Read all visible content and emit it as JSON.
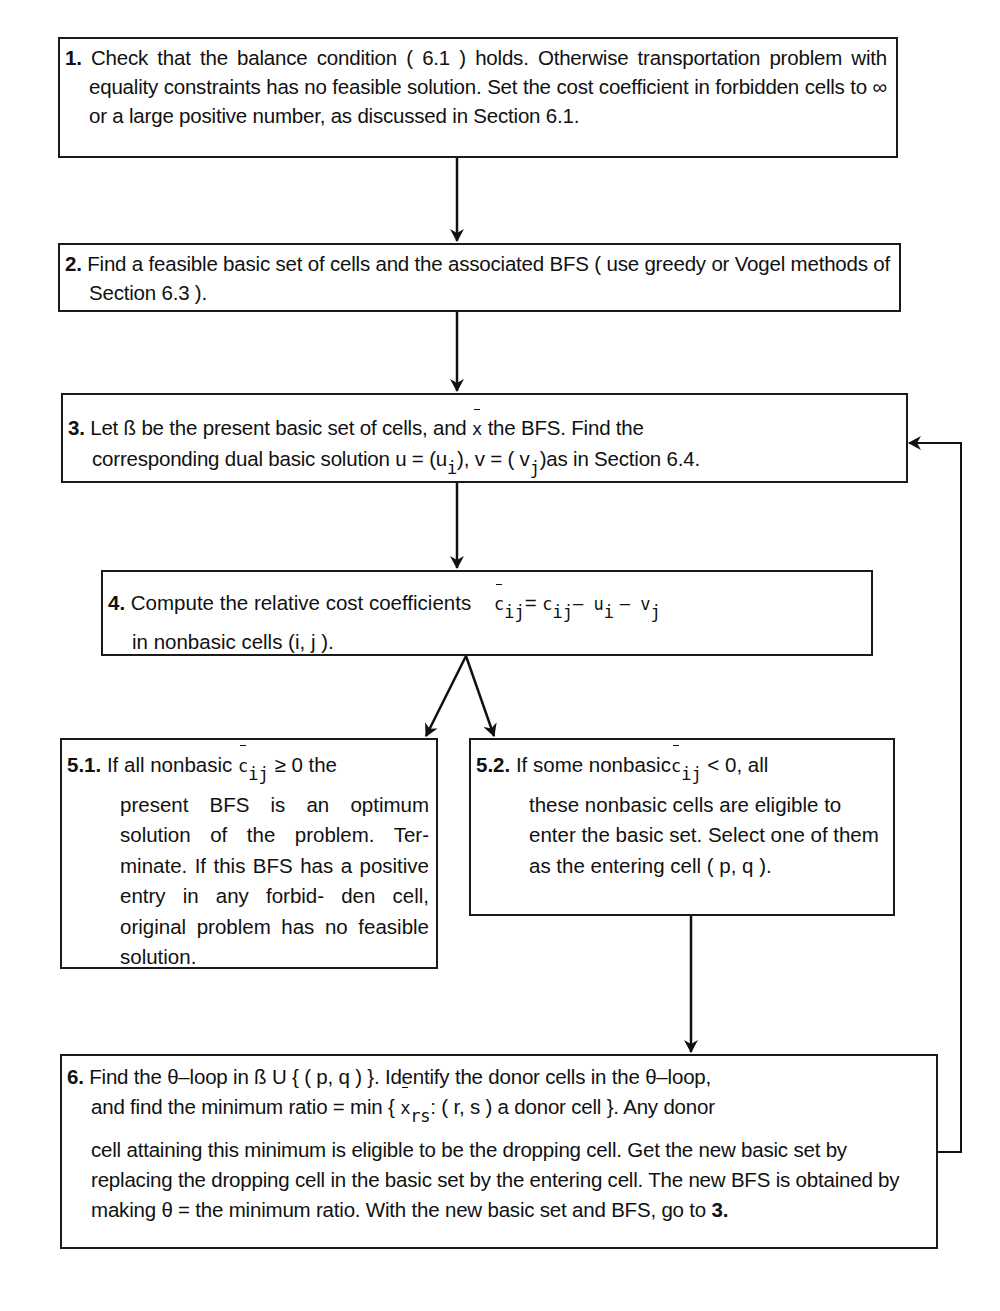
{
  "diagram": {
    "steps": [
      {
        "id": "1",
        "label": "1.",
        "text": "Check that the balance condition ( 6.1 ) holds. Otherwise transportation problem with equality constraints has no feasible solution. Set the cost coefficient in forbidden cells to ∞ or a large positive number, as discussed in Section 6.1."
      },
      {
        "id": "2",
        "label": "2.",
        "text": "Find a feasible basic set of cells and the associated BFS ( use greedy or Vogel methods of Section 6.3 )."
      },
      {
        "id": "3",
        "label": "3.",
        "line1_a": "Let ß be the present basic set of cells, and",
        "line1_sym": "x",
        "line1_b": "the BFS. Find the",
        "line2_a": "corresponding dual basic solution u = (u",
        "line2_sub1": "i",
        "line2_b": "), v = ( v",
        "line2_sub2": "j",
        "line2_c": ")as in Section 6.4."
      },
      {
        "id": "4",
        "label": "4.",
        "line1": "Compute the relative cost coefficients",
        "formula_lhs": "c",
        "formula_lhs_sub": "ij",
        "formula_eq": "=",
        "formula_c": "c",
        "formula_c_sub": "ij",
        "formula_minus1": "– u",
        "formula_u_sub": "i",
        "formula_minus2": "– v",
        "formula_v_sub": "j",
        "line2": "in nonbasic cells (i, j )."
      },
      {
        "id": "5.1",
        "label": "5.1.",
        "line1_a": "If all nonbasic",
        "line1_sym": "c",
        "line1_sub": "ij",
        "line1_rel": "≥",
        "line1_b": "0 the",
        "rest": "present BFS is an optimum solution of the problem. Ter- minate. If this BFS has a positive entry in any forbid- den cell, original problem has no feasible solution."
      },
      {
        "id": "5.2",
        "label": "5.2.",
        "line1_a": "If some nonbasic",
        "line1_sym": "c",
        "line1_sub": "ij",
        "line1_b": "< 0, all",
        "rest": "these nonbasic cells are eligible to enter the basic set. Select one of them as the entering cell ( p, q )."
      },
      {
        "id": "6",
        "label": "6.",
        "line1": "Find the θ–loop in ß U { ( p, q ) }. Identify the donor cells in the θ–loop,",
        "line2_a": "and find the minimum ratio = min {",
        "line2_sym": "x",
        "line2_sub": "rs",
        "line2_b": ": ( r, s ) a donor cell }. Any donor",
        "rest_a": "cell attaining this minimum is eligible to be the dropping cell. Get the new basic set by replacing the dropping cell in the basic set by the entering cell. The new BFS is obtained by making θ = the minimum ratio. With the new basic set and BFS, go to",
        "goto": "3."
      }
    ],
    "edges": [
      {
        "from": "1",
        "to": "2"
      },
      {
        "from": "2",
        "to": "3"
      },
      {
        "from": "3",
        "to": "4"
      },
      {
        "from": "4",
        "to": "5.1"
      },
      {
        "from": "4",
        "to": "5.2"
      },
      {
        "from": "5.2",
        "to": "6"
      },
      {
        "from": "6",
        "to": "3",
        "type": "loop-back"
      }
    ]
  }
}
